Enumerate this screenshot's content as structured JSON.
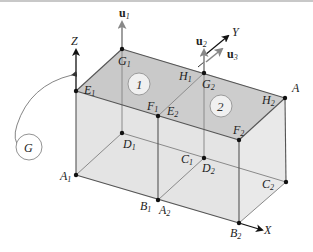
{
  "diagram": {
    "axes": {
      "x": "X",
      "y": "Y",
      "z": "Z"
    },
    "vectors": [
      {
        "name": "u",
        "sub": "1"
      },
      {
        "name": "u",
        "sub": "2"
      },
      {
        "name": "u",
        "sub": "3"
      }
    ],
    "faces": [
      {
        "label": "1"
      },
      {
        "label": "2"
      }
    ],
    "rotation_label": "G",
    "points": {
      "E1": {
        "base": "E",
        "sub": "1"
      },
      "G1": {
        "base": "G",
        "sub": "1"
      },
      "F1": {
        "base": "F",
        "sub": "1"
      },
      "E2": {
        "base": "E",
        "sub": "2"
      },
      "H1": {
        "base": "H",
        "sub": "1"
      },
      "G2": {
        "base": "G",
        "sub": "2"
      },
      "H2": {
        "base": "H",
        "sub": "2"
      },
      "A": {
        "base": "A",
        "sub": ""
      },
      "F2": {
        "base": "F",
        "sub": "2"
      },
      "D1": {
        "base": "D",
        "sub": "1"
      },
      "C1": {
        "base": "C",
        "sub": "1"
      },
      "D2": {
        "base": "D",
        "sub": "2"
      },
      "A1": {
        "base": "A",
        "sub": "1"
      },
      "B1": {
        "base": "B",
        "sub": "1"
      },
      "A2": {
        "base": "A",
        "sub": "2"
      },
      "C2": {
        "base": "C",
        "sub": "2"
      },
      "B2": {
        "base": "B",
        "sub": "2"
      }
    },
    "colors": {
      "top_face": "#c9c9c9",
      "side_face": "#e2e2e2",
      "edge": "#555555",
      "hidden_edge": "#8a8a8a",
      "vector": "#888888",
      "axis": "#111111"
    }
  }
}
